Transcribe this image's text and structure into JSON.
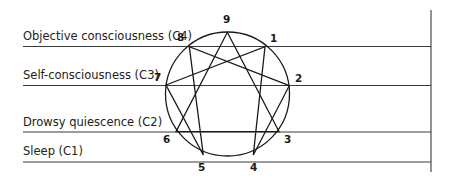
{
  "diagram": {
    "type": "enneagram",
    "levels": [
      {
        "label": "Objective consciousness (C4)",
        "y": 46.5
      },
      {
        "label": "Self-consciousness (C3)",
        "y": 85.5
      },
      {
        "label": "Drowsy quiescence (C2)",
        "y": 132
      },
      {
        "label": "Sleep (C1)",
        "y": 162
      }
    ],
    "points": [
      {
        "id": "9",
        "x": 227.3,
        "y": 32.3
      },
      {
        "id": "1",
        "x": 265,
        "y": 46.7
      },
      {
        "id": "2",
        "x": 289.3,
        "y": 85.7
      },
      {
        "id": "3",
        "x": 279,
        "y": 131.5
      },
      {
        "id": "4",
        "x": 253.3,
        "y": 155
      },
      {
        "id": "5",
        "x": 203.3,
        "y": 155
      },
      {
        "id": "6",
        "x": 176,
        "y": 131.7
      },
      {
        "id": "7",
        "x": 166,
        "y": 85
      },
      {
        "id": "8",
        "x": 189.3,
        "y": 46.7
      }
    ],
    "triangle": [
      "9",
      "3",
      "6"
    ],
    "hexad": [
      "1",
      "4",
      "2",
      "8",
      "5",
      "7"
    ],
    "line_color": "#333333"
  }
}
